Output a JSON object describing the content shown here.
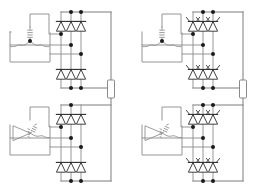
{
  "figure": {
    "background_color": "#ffffff",
    "width": 264,
    "height": 186,
    "wire_color": "#8a8a8a",
    "device_color": "#2b2b2b",
    "node_color": "#1a1a1a"
  },
  "layout": {
    "rows": 2,
    "columns": 2,
    "panel_count": 4
  },
  "panels": [
    {
      "id": "top-left",
      "position": "top-left",
      "origin_x": 4,
      "origin_y": 4,
      "transformer": {
        "type": "wye-star-secondary",
        "symbol_name": "star-winding-icon",
        "phases": 3,
        "has_center_node": true
      },
      "bridge": {
        "type": "diode-bridge",
        "device": "diode",
        "device_count": 6,
        "legs": 3,
        "controlled": false,
        "gate_leads": false
      },
      "output": {
        "has_load": true,
        "load_symbol": "resistor-box"
      }
    },
    {
      "id": "top-right",
      "position": "top-right",
      "origin_x": 136,
      "origin_y": 4,
      "transformer": {
        "type": "wye-star-secondary",
        "symbol_name": "star-winding-icon",
        "phases": 3,
        "has_center_node": true
      },
      "bridge": {
        "type": "thyristor-bridge",
        "device": "thyristor",
        "device_count": 6,
        "legs": 3,
        "controlled": true,
        "gate_leads": true
      },
      "output": {
        "has_load": true,
        "load_symbol": "resistor-box"
      }
    },
    {
      "id": "bottom-left",
      "position": "bottom-left",
      "origin_x": 4,
      "origin_y": 97,
      "transformer": {
        "type": "delta-zigzag-secondary",
        "symbol_name": "delta-winding-icon",
        "phases": 3,
        "has_center_node": false
      },
      "bridge": {
        "type": "diode-bridge",
        "device": "diode",
        "device_count": 6,
        "legs": 3,
        "controlled": false,
        "gate_leads": false
      },
      "output": {
        "has_load": false,
        "load_symbol": ""
      }
    },
    {
      "id": "bottom-right",
      "position": "bottom-right",
      "origin_x": 136,
      "origin_y": 97,
      "transformer": {
        "type": "delta-zigzag-secondary",
        "symbol_name": "delta-winding-icon",
        "phases": 3,
        "has_center_node": false
      },
      "bridge": {
        "type": "thyristor-bridge",
        "device": "thyristor",
        "device_count": 6,
        "legs": 3,
        "controlled": true,
        "gate_leads": true
      },
      "output": {
        "has_load": false,
        "load_symbol": ""
      }
    }
  ],
  "shared": {
    "left_column_output_rail": {
      "name": "dc-output-rail-left",
      "load_label": ""
    },
    "right_column_output_rail": {
      "name": "dc-output-rail-right",
      "load_label": ""
    }
  }
}
